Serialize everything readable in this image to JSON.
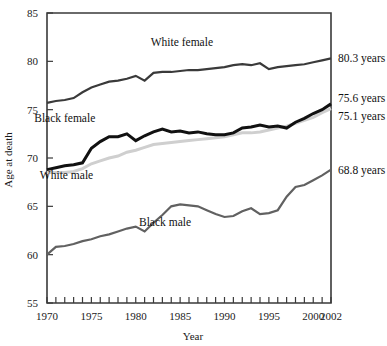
{
  "chart_data": {
    "type": "line",
    "title": "",
    "xlabel": "Year",
    "ylabel": "Age at death",
    "xlim": [
      1970,
      2002
    ],
    "ylim": [
      55,
      85
    ],
    "grid": false,
    "legend_position": "inline-annotations",
    "xticks": [
      1970,
      1975,
      1980,
      1985,
      1990,
      1995,
      2000,
      2002
    ],
    "xtick_labels": [
      "1970",
      "1975",
      "1980",
      "1985",
      "1990",
      "1995",
      "2000",
      "2002"
    ],
    "xtick_minor_step": 1,
    "yticks": [
      55,
      60,
      65,
      70,
      75,
      80,
      85
    ],
    "ytick_labels": [
      "55",
      "60",
      "65",
      "70",
      "75",
      "80",
      "85"
    ],
    "x": [
      1970,
      1971,
      1972,
      1973,
      1974,
      1975,
      1976,
      1977,
      1978,
      1979,
      1980,
      1981,
      1982,
      1983,
      1984,
      1985,
      1986,
      1987,
      1988,
      1989,
      1990,
      1991,
      1992,
      1993,
      1994,
      1995,
      1996,
      1997,
      1998,
      1999,
      2000,
      2001,
      2002
    ],
    "series": [
      {
        "name": "White female",
        "color": "#3a3a3a",
        "stroke_width": 2.2,
        "end_label": "80.3 years",
        "end_value": 80.3,
        "label_x": 1985.2,
        "label_y": 81.6,
        "values": [
          75.7,
          75.9,
          76.0,
          76.2,
          76.8,
          77.3,
          77.6,
          77.9,
          78.0,
          78.2,
          78.5,
          78.0,
          78.8,
          78.9,
          78.9,
          79.0,
          79.1,
          79.1,
          79.2,
          79.3,
          79.4,
          79.6,
          79.7,
          79.6,
          79.8,
          79.2,
          79.4,
          79.5,
          79.6,
          79.7,
          79.9,
          80.1,
          80.3
        ]
      },
      {
        "name": "Black female",
        "color": "#111111",
        "stroke_width": 3.0,
        "end_label": "75.6 years",
        "end_value": 75.6,
        "label_x": 1972.0,
        "label_y": 73.7,
        "values": [
          68.8,
          69.0,
          69.2,
          69.3,
          69.5,
          71.0,
          71.7,
          72.2,
          72.2,
          72.5,
          71.8,
          72.3,
          72.7,
          73.0,
          72.7,
          72.8,
          72.6,
          72.7,
          72.5,
          72.4,
          72.4,
          72.6,
          73.1,
          73.2,
          73.4,
          73.2,
          73.3,
          73.1,
          73.7,
          74.1,
          74.6,
          75.0,
          75.6
        ]
      },
      {
        "name": "White male",
        "color": "#cfcfcf",
        "stroke_width": 3.0,
        "end_label": "75.1 years",
        "end_value": 75.1,
        "label_x": 1972.2,
        "label_y": 67.8,
        "values": [
          68.5,
          68.5,
          68.5,
          68.6,
          68.9,
          69.4,
          69.7,
          70.0,
          70.2,
          70.6,
          70.8,
          71.1,
          71.4,
          71.5,
          71.6,
          71.7,
          71.8,
          71.9,
          72.0,
          72.1,
          72.2,
          72.4,
          72.6,
          72.6,
          72.7,
          72.9,
          73.1,
          73.3,
          73.6,
          73.9,
          74.2,
          74.7,
          75.1
        ]
      },
      {
        "name": "Black male",
        "color": "#616161",
        "stroke_width": 2.2,
        "end_label": "68.8 years",
        "end_value": 68.8,
        "label_x": 1983.3,
        "label_y": 63.0,
        "values": [
          60.0,
          60.8,
          60.9,
          61.1,
          61.4,
          61.6,
          61.9,
          62.1,
          62.4,
          62.7,
          62.9,
          62.4,
          63.3,
          64.1,
          65.0,
          65.2,
          65.1,
          65.0,
          64.6,
          64.2,
          63.9,
          64.0,
          64.5,
          64.8,
          64.2,
          64.3,
          64.6,
          66.0,
          67.0,
          67.2,
          67.7,
          68.2,
          68.8
        ]
      }
    ]
  }
}
